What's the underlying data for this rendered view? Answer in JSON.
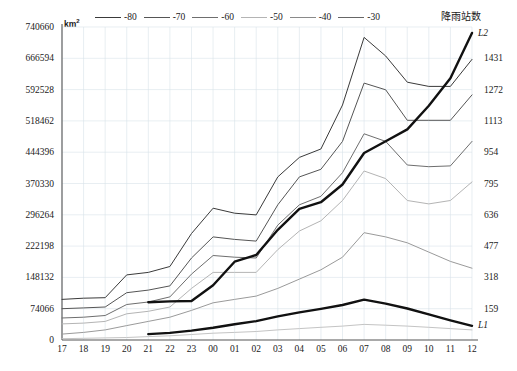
{
  "axes": {
    "left_unit": "km",
    "left_unit_sup": "2",
    "left_ticks": [
      "740660",
      "666594",
      "592528",
      "518462",
      "444396",
      "370330",
      "296264",
      "222198",
      "148132",
      "74066",
      "0"
    ],
    "right_title": "降雨站数",
    "right_ticks": [
      "1431",
      "1272",
      "1113",
      "954",
      "795",
      "636",
      "477",
      "318",
      "159"
    ],
    "x_ticks": [
      "17",
      "18",
      "19",
      "20",
      "21",
      "22",
      "23",
      "00",
      "01",
      "02",
      "03",
      "04",
      "05",
      "06",
      "07",
      "08",
      "09",
      "10",
      "11",
      "12"
    ]
  },
  "legend": {
    "items": [
      {
        "label": "-80",
        "color": "#3a3a3a"
      },
      {
        "label": "-70",
        "color": "#555555"
      },
      {
        "label": "-60",
        "color": "#6e6e6e"
      },
      {
        "label": "-50",
        "color": "#a8a8a8"
      },
      {
        "label": "-40",
        "color": "#888888"
      },
      {
        "label": "-30",
        "color": "#666666"
      }
    ]
  },
  "series_labels": {
    "l1": "L1",
    "l2": "L2"
  },
  "chart_data": {
    "type": "line",
    "title": "",
    "xlabel": "",
    "ylabel": "km2",
    "y2label": "降雨站数",
    "x": [
      "17",
      "18",
      "19",
      "20",
      "21",
      "22",
      "23",
      "00",
      "01",
      "02",
      "03",
      "04",
      "05",
      "06",
      "07",
      "08",
      "09",
      "10",
      "11",
      "12"
    ],
    "ylim": [
      0,
      740660
    ],
    "y2lim": [
      0,
      1590
    ],
    "grid": true,
    "legend_position": "top",
    "series": [
      {
        "name": "-80",
        "axis": "left",
        "color": "#3a3a3a",
        "width": 1.0,
        "values": [
          96000,
          99000,
          100000,
          154000,
          160000,
          174000,
          252000,
          312000,
          300000,
          296000,
          386000,
          432000,
          452000,
          556000,
          716000,
          672000,
          610000,
          600000,
          600000,
          664000
        ]
      },
      {
        "name": "-70",
        "axis": "left",
        "color": "#555555",
        "width": 1.0,
        "values": [
          74000,
          76000,
          78000,
          112000,
          118000,
          128000,
          194000,
          244000,
          238000,
          234000,
          320000,
          386000,
          404000,
          470000,
          608000,
          592000,
          520000,
          520000,
          520000,
          580000
        ]
      },
      {
        "name": "-60",
        "axis": "left",
        "color": "#6e6e6e",
        "width": 1.0,
        "values": [
          52000,
          54000,
          58000,
          84000,
          90000,
          102000,
          156000,
          200000,
          196000,
          194000,
          272000,
          320000,
          340000,
          396000,
          488000,
          470000,
          414000,
          410000,
          412000,
          470000
        ]
      },
      {
        "name": "-50",
        "axis": "left",
        "color": "#b4b4b4",
        "width": 1.0,
        "values": [
          38000,
          40000,
          44000,
          62000,
          68000,
          78000,
          122000,
          160000,
          160000,
          160000,
          214000,
          258000,
          282000,
          330000,
          400000,
          382000,
          330000,
          322000,
          330000,
          374000
        ]
      },
      {
        "name": "-40",
        "axis": "left",
        "color": "#9a9a9a",
        "width": 1.0,
        "values": [
          14000,
          18000,
          24000,
          34000,
          44000,
          54000,
          70000,
          88000,
          96000,
          104000,
          122000,
          144000,
          166000,
          196000,
          254000,
          244000,
          230000,
          208000,
          186000,
          170000
        ]
      },
      {
        "name": "-30",
        "axis": "left",
        "color": "#c4c4c4",
        "width": 1.0,
        "values": [
          3000,
          4000,
          5000,
          6000,
          8000,
          10000,
          13000,
          16000,
          18000,
          20000,
          24000,
          27000,
          30000,
          33000,
          37000,
          35000,
          33000,
          30000,
          27000,
          24000
        ]
      },
      {
        "name": "L1",
        "axis": "right",
        "color": "#111111",
        "width": 2.4,
        "values": [
          null,
          null,
          null,
          null,
          30,
          36,
          48,
          62,
          80,
          96,
          120,
          140,
          158,
          178,
          205,
          185,
          160,
          130,
          100,
          72
        ]
      },
      {
        "name": "L2",
        "axis": "right",
        "color": "#111111",
        "width": 2.4,
        "values": [
          null,
          null,
          null,
          null,
          192,
          196,
          198,
          278,
          398,
          432,
          560,
          666,
          700,
          790,
          950,
          1010,
          1070,
          1190,
          1330,
          1560
        ]
      }
    ]
  }
}
